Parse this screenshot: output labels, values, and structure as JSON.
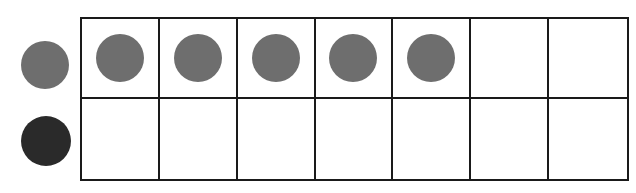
{
  "diagram": {
    "type": "counting-frame",
    "rows": 2,
    "columns": 7,
    "legend_counters": [
      {
        "name": "gray-counter",
        "color": "#6e6e6e"
      },
      {
        "name": "black-counter",
        "color": "#2a2a2a"
      }
    ],
    "cells": [
      [
        {
          "filled": true,
          "color": "#6e6e6e"
        },
        {
          "filled": true,
          "color": "#6e6e6e"
        },
        {
          "filled": true,
          "color": "#6e6e6e"
        },
        {
          "filled": true,
          "color": "#6e6e6e"
        },
        {
          "filled": true,
          "color": "#6e6e6e"
        },
        {
          "filled": false
        },
        {
          "filled": false
        }
      ],
      [
        {
          "filled": false
        },
        {
          "filled": false
        },
        {
          "filled": false
        },
        {
          "filled": false
        },
        {
          "filled": false
        },
        {
          "filled": false
        },
        {
          "filled": false
        }
      ]
    ],
    "filled_count": 5,
    "grid_line_color": "#1a1a1a"
  }
}
